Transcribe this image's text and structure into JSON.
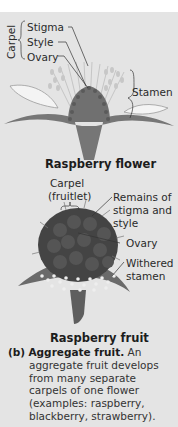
{
  "flower_diagram": {
    "labels": {
      "carpel": "Carpel",
      "stigma": "Stigma",
      "style": "Style",
      "ovary": "Ovary",
      "stamen": "Stamen"
    },
    "title": "Raspberry flower"
  },
  "fruit_diagram": {
    "labels": {
      "carpel_line1": "Carpel",
      "carpel_line2": "(fruitlet)",
      "remains_line1": "Remains of",
      "remains_line2": "stigma and",
      "remains_line3": "style",
      "ovary": "Ovary",
      "withered_line1": "Withered",
      "withered_line2": "stamen"
    },
    "title": "Raspberry fruit"
  },
  "caption": {
    "marker": "(b)",
    "heading": "Aggregate fruit.",
    "first_line_rest": "An",
    "lines": [
      "aggregate fruit develops",
      "from many separate",
      "carpels of one flower",
      "(examples: raspberry,",
      "blackberry, strawberry)."
    ]
  },
  "colors": {
    "panel": "#e4e4e4",
    "plant": "#6f6f6f",
    "fruit": "#4a4a4a",
    "text": "#2a2a2a"
  }
}
